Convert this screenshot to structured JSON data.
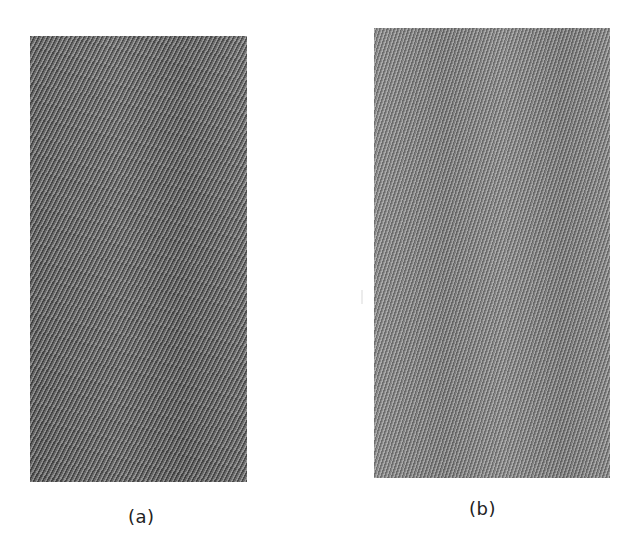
{
  "figure": {
    "panels": [
      {
        "id": "a",
        "label": "(a)",
        "description": "Twill fabric swatch, darker gray, diagonal weave lines at shallower angle",
        "base_color": "#7d7d7d"
      },
      {
        "id": "b",
        "label": "(b)",
        "description": "Twill fabric swatch, lighter gray, diagonal weave lines at steeper angle",
        "base_color": "#929292"
      }
    ],
    "background_color": "#ffffff",
    "label_color": "#222222"
  }
}
